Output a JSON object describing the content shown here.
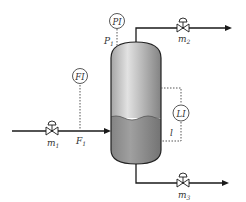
{
  "diagram": {
    "type": "process-flow-diagram",
    "colors": {
      "line": "#1a1a1a",
      "signal": "#555555",
      "vessel_vapor_light": "#d8d8d8",
      "vessel_vapor_dark": "#8a8a8a",
      "vessel_liquid": "#8f8f8f",
      "instrument_fill": "#ffffff"
    },
    "vessel": {
      "name": "separator-vessel"
    },
    "instruments": [
      {
        "id": "pi",
        "tag": "PI",
        "signal_label": "P",
        "signal_sub": "1"
      },
      {
        "id": "fi",
        "tag": "FI",
        "signal_label": "F",
        "signal_sub": "1"
      },
      {
        "id": "li",
        "tag": "LI",
        "signal_label": "l",
        "signal_sub": ""
      }
    ],
    "valves": [
      {
        "id": "m1",
        "label": "m",
        "sub": "1",
        "stream": "feed-inlet"
      },
      {
        "id": "m2",
        "label": "m",
        "sub": "2",
        "stream": "vapor-outlet"
      },
      {
        "id": "m3",
        "label": "m",
        "sub": "3",
        "stream": "liquid-outlet"
      }
    ]
  }
}
